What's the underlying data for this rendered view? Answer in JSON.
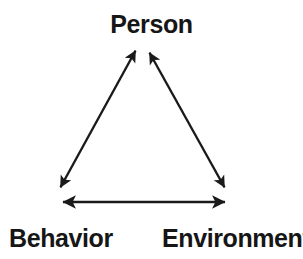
{
  "diagram": {
    "type": "triangle-reciprocal-determinism",
    "background_color": "#ffffff",
    "stroke_color": "#1a1a1a",
    "stroke_width": 2.2,
    "nodes": [
      {
        "id": "person",
        "label": "Person",
        "position": "top"
      },
      {
        "id": "behavior",
        "label": "Behavior",
        "position": "bottom-left"
      },
      {
        "id": "environment",
        "label": "Environment",
        "position": "bottom-right"
      }
    ],
    "edges": [
      {
        "id": "behavior-person",
        "from": "behavior",
        "to": "person",
        "arrowheads": "both",
        "from_point": [
          59,
          190
        ],
        "to_point": [
          137,
          48
        ]
      },
      {
        "id": "person-environment",
        "from": "person",
        "to": "environment",
        "arrowheads": "both",
        "from_point": [
          148,
          50
        ],
        "to_point": [
          226,
          190
        ]
      },
      {
        "id": "behavior-environment",
        "from": "behavior",
        "to": "environment",
        "arrowheads": "both",
        "from_point": [
          60,
          202
        ],
        "to_point": [
          228,
          202
        ]
      }
    ]
  }
}
